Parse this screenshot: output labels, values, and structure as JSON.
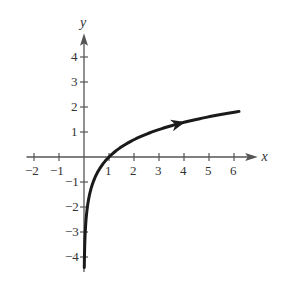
{
  "chart_data": {
    "type": "line",
    "title": "",
    "xlabel": "x",
    "ylabel": "y",
    "xlim": [
      -2,
      6.6
    ],
    "ylim": [
      -4.5,
      4.6
    ],
    "x_ticks": [
      "-2",
      "-1",
      "1",
      "2",
      "3",
      "4",
      "5",
      "6"
    ],
    "y_ticks": [
      "-4",
      "-3",
      "-2",
      "-1",
      "1",
      "2",
      "3",
      "4"
    ],
    "grid": false,
    "series": [
      {
        "name": "y = ln x",
        "x": [
          0.012,
          0.05,
          0.1,
          0.25,
          0.5,
          1,
          2,
          3,
          4,
          5,
          6.2
        ],
        "y": [
          -4.4,
          -3.0,
          -2.3,
          -1.39,
          -0.69,
          0,
          0.69,
          1.1,
          1.39,
          1.61,
          1.82
        ]
      }
    ],
    "annotations": [
      "direction arrow on curve near x=3.8"
    ]
  }
}
